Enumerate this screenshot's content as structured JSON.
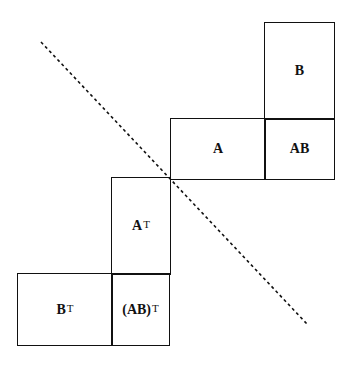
{
  "diagram": {
    "boxes": [
      {
        "id": "B",
        "label": "B",
        "sup": ""
      },
      {
        "id": "A",
        "label": "A",
        "sup": ""
      },
      {
        "id": "AB",
        "label": "AB",
        "sup": ""
      },
      {
        "id": "AT",
        "label": "A",
        "sup": "T"
      },
      {
        "id": "BT",
        "label": "B",
        "sup": "T"
      },
      {
        "id": "ABT",
        "label": "(AB)",
        "sup": "T"
      }
    ],
    "mirror_line": {
      "style": "dashed",
      "from": [
        41,
        42
      ],
      "to": [
        307,
        324
      ]
    }
  }
}
